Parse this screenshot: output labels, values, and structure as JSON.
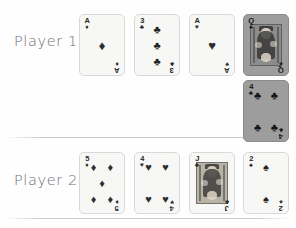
{
  "board": {
    "background_color": "#fefefe",
    "divider_color": "#bababa"
  },
  "rows": [
    {
      "label": "Player 1",
      "cards": [
        {
          "rank": "A",
          "rank_display": "A",
          "suit": "diamonds",
          "suit_symbol": "♦",
          "color": "red",
          "highlighted": false,
          "name": "ace-of-diamonds",
          "pip_count": 1
        },
        {
          "rank": "3",
          "rank_display": "3",
          "suit": "clubs",
          "suit_symbol": "♣",
          "color": "black",
          "highlighted": false,
          "name": "three-of-clubs",
          "pip_count": 3
        },
        {
          "rank": "A",
          "rank_display": "A",
          "suit": "hearts",
          "suit_symbol": "♥",
          "color": "red",
          "highlighted": false,
          "name": "ace-of-hearts",
          "pip_count": 1
        },
        {
          "rank": "Q",
          "rank_display": "Q",
          "suit": "spades",
          "suit_symbol": "♠",
          "color": "black",
          "highlighted": true,
          "name": "queen-of-spades",
          "pip_count": 0,
          "is_court": true
        },
        {
          "rank": "4",
          "rank_display": "4",
          "suit": "clubs",
          "suit_symbol": "♣",
          "color": "black",
          "highlighted": true,
          "name": "four-of-clubs",
          "pip_count": 4,
          "wrapped_to_next_line": true
        }
      ]
    },
    {
      "label": "Player 2",
      "cards": [
        {
          "rank": "5",
          "rank_display": "5",
          "suit": "diamonds",
          "suit_symbol": "♦",
          "color": "red",
          "highlighted": false,
          "name": "five-of-diamonds",
          "pip_count": 5
        },
        {
          "rank": "4",
          "rank_display": "4",
          "suit": "hearts",
          "suit_symbol": "♥",
          "color": "red",
          "highlighted": false,
          "name": "four-of-hearts",
          "pip_count": 4
        },
        {
          "rank": "J",
          "rank_display": "J",
          "suit": "clubs",
          "suit_symbol": "♣",
          "color": "black",
          "highlighted": false,
          "name": "jack-of-clubs",
          "pip_count": 0,
          "is_court": true
        },
        {
          "rank": "2",
          "rank_display": "2",
          "suit": "spades",
          "suit_symbol": "♠",
          "color": "black",
          "highlighted": false,
          "name": "two-of-spades",
          "pip_count": 2
        }
      ]
    }
  ]
}
